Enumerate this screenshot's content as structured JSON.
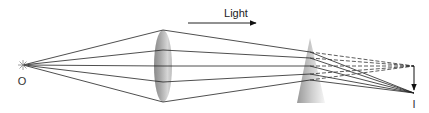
{
  "diagram": {
    "direction_label": "Light",
    "object_label": "O",
    "image_label": "I",
    "colors": {
      "ray": "#222222",
      "lens_dark": "#7a7a7a",
      "lens_light": "#d8d8d8",
      "prism_dark": "#8c8c8c",
      "prism_light": "#f2f2f2",
      "source": "#888888"
    },
    "elements": [
      "point source O",
      "converging lens",
      "thin prism",
      "image point I",
      "virtual image (dashed extensions)"
    ]
  }
}
